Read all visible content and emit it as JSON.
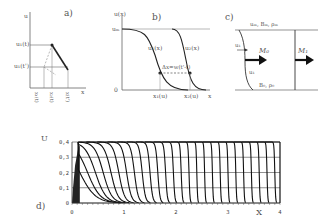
{
  "panels": {
    "a": {
      "label": "a)",
      "y_axis": "u",
      "x_axis": "x",
      "y_labels": [
        "u₁(t)",
        "u₁(t')"
      ],
      "x_labels": [
        "x₁(t)",
        "x₂(t)",
        "x(t')"
      ]
    },
    "b": {
      "label": "b)",
      "y_axis": "u(x)",
      "y_max_label": "uₘ",
      "origin": "0",
      "x_axis": "x",
      "curve_labels": [
        "u₁(x)",
        "u₂(x)"
      ],
      "x_labels": [
        "x₁(u)",
        "x₂(u)"
      ],
      "annotation": "Δx=w(t'-t)"
    },
    "c": {
      "label": "c)",
      "top_label": "uₘ, Bₘ, ρₘ",
      "bottom_label": "B₀, ρ₀",
      "left_arrow_label": "u₁",
      "lower_arrow_label": "u₁",
      "flux_left": "M₀",
      "flux_right": "M₁"
    },
    "d": {
      "label": "d)"
    }
  },
  "chart_data": {
    "type": "line",
    "title": "",
    "panel": "d)",
    "xlabel": "X",
    "ylabel": "U",
    "xlim": [
      0,
      4
    ],
    "ylim": [
      0,
      0.4
    ],
    "x_ticks": [
      "0",
      "1",
      "2",
      "3",
      "4"
    ],
    "y_ticks": [
      "0",
      "0,1",
      "0,2",
      "0,3",
      "0,4"
    ],
    "grid": true,
    "series": [
      {
        "name": "t1",
        "front_x": 0.15
      },
      {
        "name": "t2",
        "front_x": 0.3
      },
      {
        "name": "t3",
        "front_x": 0.45
      },
      {
        "name": "t4",
        "front_x": 0.6
      },
      {
        "name": "t5",
        "front_x": 0.75
      },
      {
        "name": "t6",
        "front_x": 0.9
      },
      {
        "name": "t7",
        "front_x": 1.05
      },
      {
        "name": "t8",
        "front_x": 1.2
      },
      {
        "name": "t9",
        "front_x": 1.35
      },
      {
        "name": "t10",
        "front_x": 1.5
      },
      {
        "name": "t11",
        "front_x": 1.65
      },
      {
        "name": "t12",
        "front_x": 1.8
      },
      {
        "name": "t13",
        "front_x": 1.95
      },
      {
        "name": "t14",
        "front_x": 2.1
      },
      {
        "name": "t15",
        "front_x": 2.25
      },
      {
        "name": "t16",
        "front_x": 2.4
      },
      {
        "name": "t17",
        "front_x": 2.55
      },
      {
        "name": "t18",
        "front_x": 2.7
      },
      {
        "name": "t19",
        "front_x": 2.85
      },
      {
        "name": "t20",
        "front_x": 3.0
      },
      {
        "name": "t21",
        "front_x": 3.15
      },
      {
        "name": "t22",
        "front_x": 3.3
      },
      {
        "name": "t23",
        "front_x": 3.45
      },
      {
        "name": "t24",
        "front_x": 3.6
      },
      {
        "name": "t25",
        "front_x": 3.75
      },
      {
        "name": "t26",
        "front_x": 3.9
      }
    ],
    "plateau": 0.4
  }
}
